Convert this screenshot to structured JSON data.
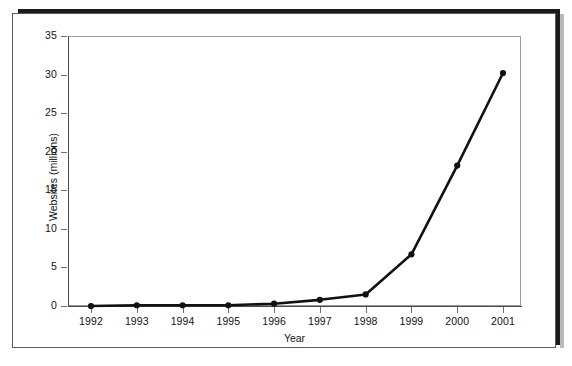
{
  "figure": {
    "background_color": "#ffffff",
    "frame_color": "#5a5a5a",
    "scan_shadow_color": "#1b1b1b"
  },
  "chart_data": {
    "type": "line",
    "title": "",
    "subtitle": "",
    "xlabel": "Year",
    "ylabel": "Websites (millions)",
    "categories": [
      "1992",
      "1993",
      "1994",
      "1995",
      "1996",
      "1997",
      "1998",
      "1999",
      "2000",
      "2001"
    ],
    "x": [
      1992,
      1993,
      1994,
      1995,
      1996,
      1997,
      1998,
      1999,
      2000,
      2001
    ],
    "values": [
      0.0,
      0.1,
      0.1,
      0.1,
      0.3,
      0.8,
      1.5,
      6.7,
      18.2,
      30.2
    ],
    "series": [
      {
        "name": "Websites",
        "values": [
          0.0,
          0.1,
          0.1,
          0.1,
          0.3,
          0.8,
          1.5,
          6.7,
          18.2,
          30.2
        ],
        "line_color": "#111111",
        "marker": "circle",
        "marker_color": "#111111"
      }
    ],
    "ylim": [
      0,
      35
    ],
    "yticks": [
      0,
      5,
      10,
      15,
      20,
      25,
      30,
      35
    ],
    "ytick_labels": [
      "0",
      "5",
      "10",
      "15",
      "20",
      "25",
      "30",
      "35"
    ],
    "xtick_labels": [
      "1992",
      "1993",
      "1994",
      "1995",
      "1996",
      "1997",
      "1998",
      "1999",
      "2000",
      "2001"
    ],
    "grid": false,
    "legend": null,
    "legend_position": "none",
    "annotations": []
  }
}
